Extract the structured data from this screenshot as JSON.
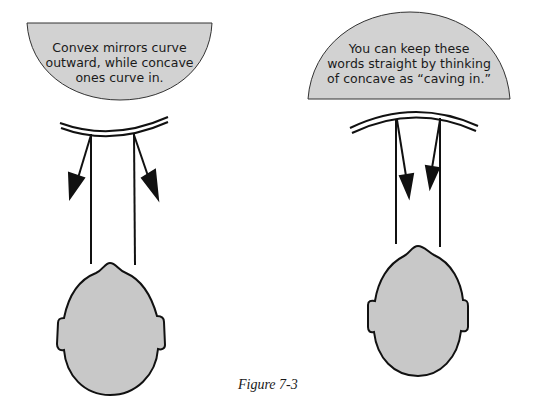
{
  "figure": {
    "caption": "Figure 7-3",
    "colors": {
      "bubble_fill": "#d2d2d2",
      "head_fill": "#c8c8c8",
      "stroke": "#111111",
      "background": "#ffffff"
    },
    "left_panel": {
      "mirror_type": "convex",
      "bubble": {
        "shape": "semicircle-down",
        "lines": [
          "Convex mirrors curve",
          "outward, while concave",
          "ones curve in."
        ]
      },
      "mirror_icon": "convex-mirror-icon",
      "rays": "diverging-reflected-rays",
      "head_icon": "head-top-view-icon"
    },
    "right_panel": {
      "mirror_type": "concave",
      "bubble": {
        "shape": "semicircle-up",
        "lines": [
          "You can keep these",
          "words straight by thinking",
          "of concave as “caving in.”"
        ]
      },
      "mirror_icon": "concave-mirror-icon",
      "rays": "converging-reflected-rays",
      "head_icon": "head-top-view-icon"
    }
  }
}
